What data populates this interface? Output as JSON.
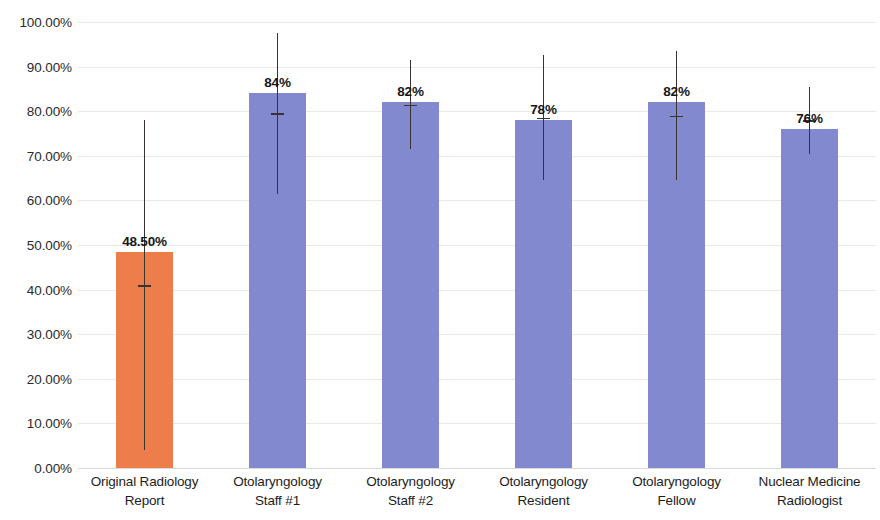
{
  "chart_data": {
    "type": "bar",
    "title": "",
    "subtitle": "",
    "xlabel": "",
    "ylabel": "",
    "ylim": [
      0,
      1.0
    ],
    "grid": true,
    "legend": "none",
    "y_tick_labels": [
      "100.00%",
      "90.00%",
      "80.00%",
      "70.00%",
      "60.00%",
      "50.00%",
      "40.00%",
      "30.00%",
      "20.00%",
      "10.00%",
      "0.00%"
    ],
    "y_tick_values": [
      1.0,
      0.9,
      0.8,
      0.7,
      0.6,
      0.5,
      0.4,
      0.3,
      0.2,
      0.1,
      0.0
    ],
    "categories": [
      "Original Radiology Report",
      "Otolaryngology Staff #1",
      "Otolaryngology Staff #2",
      "Otolaryngology Resident",
      "Otolaryngology Fellow",
      "Nuclear Medicine Radiologist"
    ],
    "category_lines": [
      [
        "Original Radiology",
        "Report"
      ],
      [
        "Otolaryngology",
        "Staff #1"
      ],
      [
        "Otolaryngology",
        "Staff #2"
      ],
      [
        "Otolaryngology",
        "Resident"
      ],
      [
        "Otolaryngology",
        "Fellow"
      ],
      [
        "Nuclear Medicine",
        "Radiologist"
      ]
    ],
    "values": [
      0.485,
      0.84,
      0.82,
      0.78,
      0.82,
      0.76
    ],
    "value_labels": [
      "48.50%",
      "84%",
      "82%",
      "78%",
      "82%",
      "76%"
    ],
    "error_low": [
      0.04,
      0.615,
      0.715,
      0.645,
      0.645,
      0.705
    ],
    "error_high": [
      0.78,
      0.975,
      0.915,
      0.925,
      0.935,
      0.855
    ],
    "bar_colors": [
      "#ED7D4B",
      "#8289CE",
      "#8289CE",
      "#8289CE",
      "#8289CE",
      "#8289CE"
    ],
    "colors": {
      "highlight_bar": "#ED7D4B",
      "standard_bar": "#8289CE",
      "gridline": "#e9e9e9",
      "axis_text": "#1d1d1d",
      "errorbar": "#3a3330",
      "background": "#ffffff"
    }
  }
}
